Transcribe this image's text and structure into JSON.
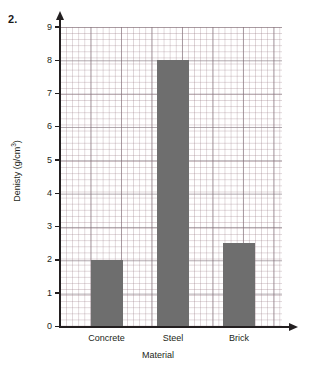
{
  "question_number": "2.",
  "chart_data": {
    "type": "bar",
    "title": "",
    "categories": [
      "Concrete",
      "Steel",
      "Brick"
    ],
    "values": [
      2.0,
      8.0,
      2.5
    ],
    "xlabel": "Material",
    "ylabel": "Denisty (g/cm",
    "ylabel_superscript": "3",
    "ylabel_suffix": ")",
    "ylim": [
      0,
      9
    ],
    "ytick_labels": [
      "0",
      "1",
      "2",
      "3",
      "4",
      "5",
      "6",
      "7",
      "8",
      "9"
    ],
    "grid": true,
    "grid_style": "graph-paper-minor-and-major",
    "legend": "none",
    "bar_color": "#6e6e6e",
    "axis_color": "#231f20",
    "grid_color": "#96788 2"
  },
  "axes": {
    "y_arrow_icon": "up-arrow-icon",
    "x_arrow_icon": "right-arrow-icon"
  }
}
